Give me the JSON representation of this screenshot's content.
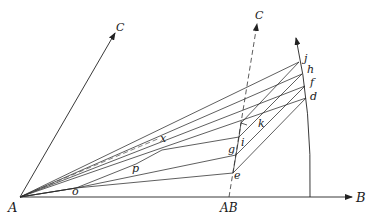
{
  "figure": {
    "type": "geometric vector construction diagram",
    "background": "#ffffff",
    "ink_color": "#222222"
  },
  "labels": {
    "A": "A",
    "B": "B",
    "C_left": "C",
    "C_right": "C",
    "AB": "AB",
    "j": "j",
    "h": "h",
    "f": "f",
    "d": "d",
    "k": "k",
    "i": "i",
    "g": "g",
    "e": "e",
    "x": "x",
    "p": "p",
    "o": "o"
  },
  "points": {
    "A": [
      20,
      197
    ],
    "B_tip": [
      352,
      197
    ],
    "C_left_tip": [
      115,
      33
    ],
    "AB": [
      229,
      197
    ],
    "C_right_tip": [
      257,
      24
    ],
    "arc_base": [
      310,
      197
    ],
    "arc_tip": [
      296,
      38
    ],
    "j": [
      299,
      62
    ],
    "h": [
      302,
      74
    ],
    "f": [
      305,
      86
    ],
    "d": [
      306,
      98
    ],
    "k": [
      241,
      123
    ],
    "i": [
      239,
      137
    ],
    "g": [
      236,
      155
    ],
    "e": [
      233,
      173
    ],
    "x": [
      162,
      140
    ],
    "p": [
      136,
      164
    ],
    "o": [
      76,
      188
    ]
  },
  "elements": {
    "axes": [
      "A→B (horizontal arrow)",
      "A→C (oblique arrow)",
      "AB→C (dashed arrow)"
    ],
    "arc": "circular arc from B-axis up to arrow tip through d, f, h, j",
    "fan_lines_from_A": [
      "A–j",
      "A–h",
      "A–f",
      "A–d",
      "A–i",
      "A–g"
    ],
    "parallel_segments": [
      "e–d",
      "g–f",
      "i–h",
      "k–j"
    ],
    "cross_segments": [
      "j–i",
      "h–g",
      "f–e"
    ]
  }
}
